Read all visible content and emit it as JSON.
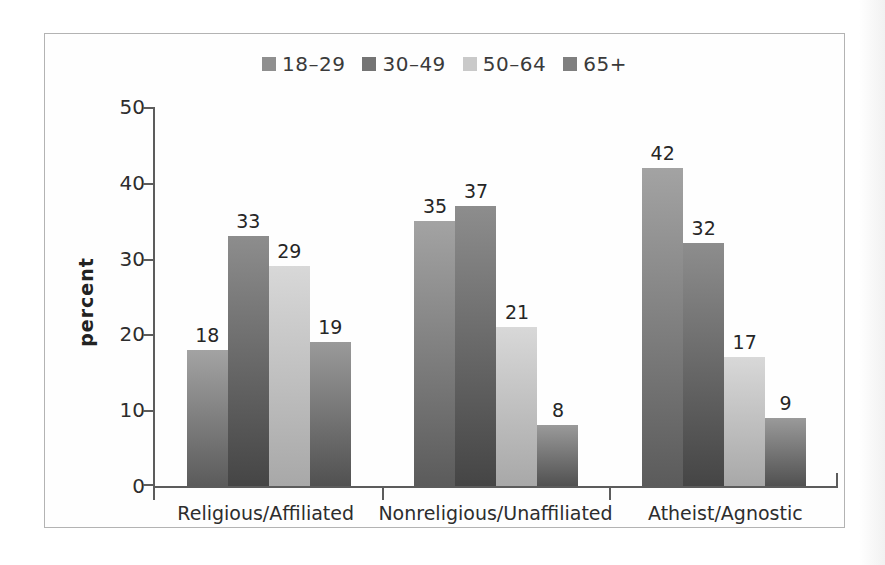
{
  "chart_data": {
    "type": "bar",
    "title": "",
    "categories": [
      "Religious/Affiliated",
      "Nonreligious/Unaffiliated",
      "Atheist/Agnostic"
    ],
    "series": [
      {
        "name": "18–29",
        "values": [
          18,
          35,
          42
        ]
      },
      {
        "name": "30–49",
        "values": [
          33,
          37,
          32
        ]
      },
      {
        "name": "50–64",
        "values": [
          29,
          21,
          17
        ]
      },
      {
        "name": "65+",
        "values": [
          19,
          8,
          9
        ]
      }
    ],
    "xlabel": "",
    "ylabel": "percent",
    "ylim": [
      0,
      50
    ],
    "yticks": [
      0,
      10,
      20,
      30,
      40,
      50
    ],
    "legend_position": "top-center",
    "grid": false,
    "bar_value_labels_shown": true
  },
  "colors": {
    "series_legend": [
      "#8f8f8f",
      "#747474",
      "#c9c9c9",
      "#7f7f7f"
    ],
    "series_bar_top": [
      "#a3a3a3",
      "#8d8d8d",
      "#d8d8d8",
      "#9a9a9a"
    ],
    "series_bar_bottom": [
      "#5b5b5b",
      "#454545",
      "#a8a8a8",
      "#515151"
    ],
    "axis": "#5c5c5c",
    "text": "#2d2d2d",
    "frame_border": "#b3b3b3",
    "background": "#ffffff"
  }
}
